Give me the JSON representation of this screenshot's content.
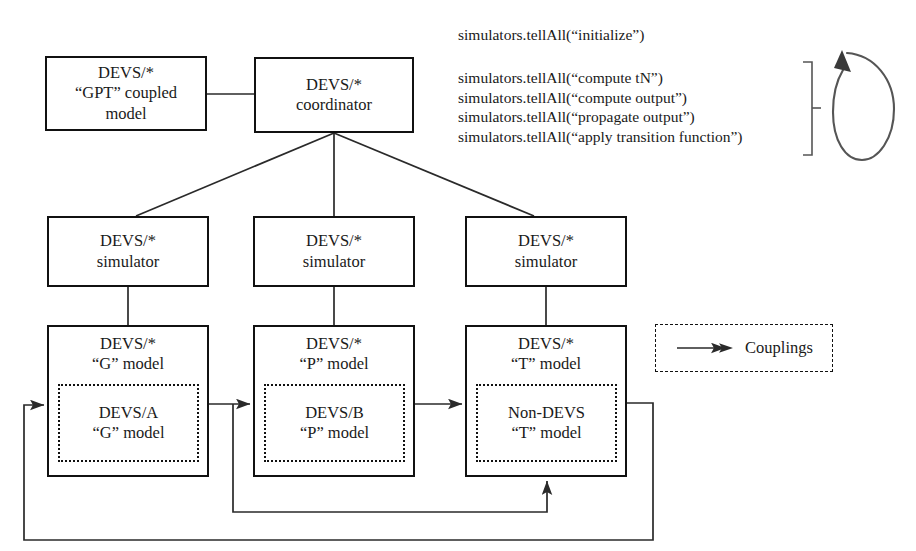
{
  "figure": {
    "type": "block-diagram"
  },
  "nodes": {
    "gpt_coupled_model": {
      "lines": [
        "DEVS/*",
        "“GPT” coupled",
        "model"
      ]
    },
    "coordinator": {
      "lines": [
        "DEVS/*",
        "coordinator"
      ]
    },
    "simulator_g": {
      "lines": [
        "DEVS/*",
        "simulator"
      ]
    },
    "simulator_p": {
      "lines": [
        "DEVS/*",
        "simulator"
      ]
    },
    "simulator_t": {
      "lines": [
        "DEVS/*",
        "simulator"
      ]
    },
    "model_g_outer": {
      "lines": [
        "DEVS/*",
        "“G” model"
      ]
    },
    "model_p_outer": {
      "lines": [
        "DEVS/*",
        "“P” model"
      ]
    },
    "model_t_outer": {
      "lines": [
        "DEVS/*",
        "“T” model"
      ]
    },
    "model_g_inner": {
      "lines": [
        "DEVS/A",
        "“G” model"
      ]
    },
    "model_p_inner": {
      "lines": [
        "DEVS/B",
        "“P” model"
      ]
    },
    "model_t_inner": {
      "lines": [
        "Non-DEVS",
        "“T” model"
      ]
    }
  },
  "protocol": {
    "initialize": "simulators.tellAll(“initialize”)",
    "cycle": [
      "simulators.tellAll(“compute tN”)",
      "simulators.tellAll(“compute output”)",
      "simulators.tellAll(“propagate output”)",
      "simulators.tellAll(“apply transition function”)"
    ]
  },
  "legend": {
    "label": "Couplings"
  },
  "colors": {
    "stroke": "#111111",
    "line": "#2a2a2a",
    "background": "#ffffff",
    "text": "#1a1a1a"
  }
}
